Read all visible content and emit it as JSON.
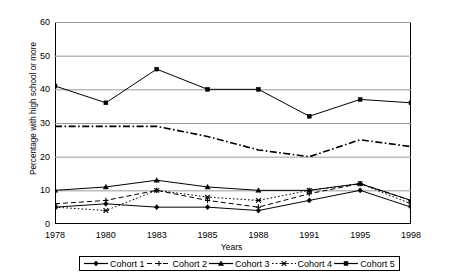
{
  "chart_data": {
    "type": "line",
    "title": "",
    "xlabel": "Years",
    "ylabel": "Percentage with high school or more",
    "categories": [
      "1978",
      "1980",
      "1983",
      "1985",
      "1988",
      "1991",
      "1995",
      "1998"
    ],
    "x": [
      1978,
      1980,
      1983,
      1985,
      1988,
      1991,
      1995,
      1998
    ],
    "ylim": [
      0,
      60
    ],
    "yticks": [
      0,
      10,
      20,
      30,
      40,
      50,
      60
    ],
    "grid": "horizontal",
    "legend_position": "bottom",
    "series": [
      {
        "name": "Cohort 1",
        "marker": "diamond",
        "linestyle": "solid",
        "color": "#000000",
        "values": [
          5,
          6,
          5,
          5,
          4,
          7,
          10,
          5
        ]
      },
      {
        "name": "Cohort 2",
        "marker": "plus",
        "linestyle": "dashed",
        "color": "#000000",
        "values": [
          6,
          7,
          10,
          7,
          5,
          9,
          12,
          7
        ]
      },
      {
        "name": "Cohort 3",
        "marker": "triangle",
        "linestyle": "solid",
        "color": "#000000",
        "values": [
          10,
          11,
          13,
          11,
          10,
          10,
          12,
          7
        ]
      },
      {
        "name": "Cohort 4",
        "marker": "x",
        "linestyle": "dotted",
        "color": "#000000",
        "values": [
          5,
          4,
          10,
          8,
          7,
          10,
          12,
          6
        ]
      },
      {
        "name": "Cohort 5",
        "marker": "square",
        "linestyle": "solid",
        "color": "#000000",
        "values": [
          41,
          36,
          46,
          40,
          40,
          32,
          37,
          36
        ]
      }
    ],
    "dashdot_series": {
      "name": "Cohort 3",
      "values": [
        29,
        29,
        29,
        26,
        22,
        20,
        25,
        23
      ]
    }
  },
  "axis": {
    "y_ticks": [
      "0",
      "10",
      "20",
      "30",
      "40",
      "50",
      "60"
    ],
    "x_ticks": [
      "1978",
      "1980",
      "1983",
      "1985",
      "1988",
      "1991",
      "1995",
      "1998"
    ],
    "y_title": "Percentage with high school or more",
    "x_title": "Years"
  },
  "legend": {
    "items": [
      {
        "label": "Cohort 1",
        "marker": "diamond-marker-icon",
        "style": "solid"
      },
      {
        "label": "Cohort 2",
        "marker": "plus-marker-icon",
        "style": "dashed"
      },
      {
        "label": "Cohort 3",
        "marker": "triangle-marker-icon",
        "style": "solid"
      },
      {
        "label": "Cohort 4",
        "marker": "x-marker-icon",
        "style": "dotted"
      },
      {
        "label": "Cohort 5",
        "marker": "square-marker-icon",
        "style": "solid"
      }
    ]
  },
  "colors": {
    "line": "#000000",
    "grid": "#808080",
    "background": "#ffffff",
    "axis": "#000000"
  }
}
